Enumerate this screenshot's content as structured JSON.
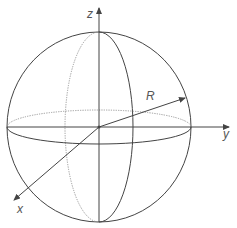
{
  "diagram": {
    "type": "sphere-coordinate-axes",
    "labels": {
      "z_axis": "z",
      "y_axis": "y",
      "x_axis": "x",
      "radius": "R"
    },
    "colors": {
      "stroke": "#444444",
      "dotted_stroke": "#888888",
      "label": "#555555"
    },
    "geometry": {
      "center": [
        99,
        127
      ],
      "sphere_radius": 93,
      "meridian_rx": 34,
      "equator_ry": 17
    }
  }
}
